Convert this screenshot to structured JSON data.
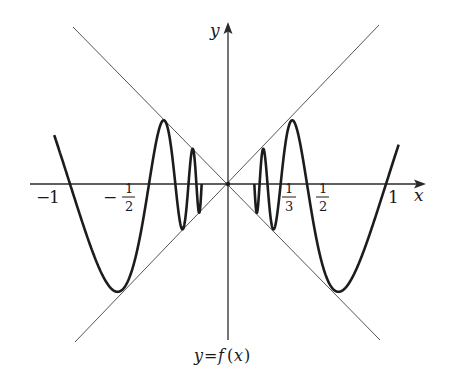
{
  "figure": {
    "function_label": "y = f(x)",
    "function_label_parts": {
      "y": "y",
      "eq": "=",
      "f": "f",
      "lp": "(",
      "x": "x",
      "rp": ")"
    },
    "x_axis_label": "x",
    "y_axis_label": "y",
    "colors": {
      "curve": "#1c1c1c",
      "axis": "#2a2a2a",
      "guide": "#555555",
      "background": "#ffffff"
    }
  },
  "ticks": {
    "neg_one": {
      "sign": "−",
      "num": "1"
    },
    "neg_half": {
      "sign": "−",
      "num": "1",
      "den": "2"
    },
    "third": {
      "num": "1",
      "den": "3"
    },
    "half": {
      "num": "1",
      "den": "2"
    },
    "one": {
      "num": "1"
    }
  },
  "chart_data": {
    "type": "line",
    "title": "",
    "xlabel": "x",
    "ylabel": "y",
    "function": "f(x) = x·sin(π/x)",
    "guide_lines": [
      "y = x",
      "y = -x"
    ],
    "x_tick_labels": [
      "-1",
      "-1/2",
      "1/3",
      "1/2",
      "1"
    ],
    "xlim": [
      -1.1,
      1.25
    ],
    "ylim": [
      -1.0,
      1.03
    ],
    "grid": false,
    "legend": "none",
    "series": [
      {
        "name": "y = f(x) (right branch)",
        "x": [
          0.167,
          0.2,
          0.25,
          0.286,
          0.333,
          0.4,
          0.42,
          0.5,
          0.6,
          0.72,
          0.85,
          1.0,
          1.08
        ],
        "y": [
          0.0,
          0.0,
          0.0,
          -0.13,
          0.0,
          0.4,
          0.41,
          0.0,
          -0.52,
          -0.71,
          -0.47,
          0.0,
          0.25
        ]
      },
      {
        "name": "y = f(x) (left branch, even mirror)",
        "x": [
          -0.167,
          -0.2,
          -0.25,
          -0.286,
          -0.333,
          -0.4,
          -0.42,
          -0.5,
          -0.6,
          -0.72,
          -0.85,
          -1.0,
          -1.1
        ],
        "y": [
          0.0,
          0.0,
          0.0,
          -0.13,
          0.0,
          0.4,
          0.41,
          0.0,
          -0.52,
          -0.71,
          -0.47,
          0.0,
          0.31
        ]
      }
    ]
  }
}
